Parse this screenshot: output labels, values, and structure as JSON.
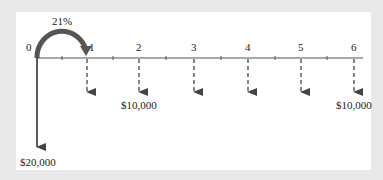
{
  "diagram": {
    "type": "cash-flow-timeline",
    "interest_rate_label": "21%",
    "periods": [
      "0",
      "1",
      "2",
      "3",
      "4",
      "5",
      "6"
    ],
    "initial_outflow": {
      "period": "0",
      "label": "$20,000"
    },
    "payments": [
      {
        "period": "1",
        "label": ""
      },
      {
        "period": "2",
        "label": "$10,000"
      },
      {
        "period": "3",
        "label": ""
      },
      {
        "period": "4",
        "label": ""
      },
      {
        "period": "5",
        "label": ""
      },
      {
        "period": "6",
        "label": "$10,000"
      }
    ],
    "colors": {
      "background": "#e9e9e9",
      "panel": "#ffffff",
      "arc": "#555555",
      "line": "#444444"
    }
  }
}
